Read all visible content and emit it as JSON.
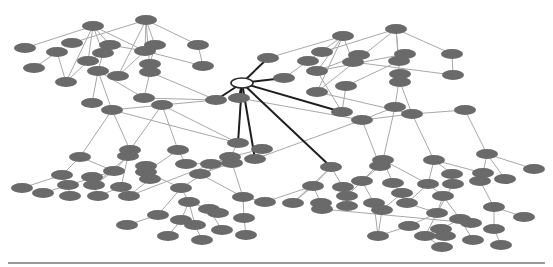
{
  "diagram": {
    "type": "network-graph",
    "colors": {
      "background": "#ffffff",
      "node_fill": "#6a6a6a",
      "edge": "#a8a8a8",
      "hub_edge": "#1e1e1e",
      "hub_fill": "#ffffff",
      "baseline": "#9a9a9a"
    },
    "node_size": {
      "rx": 11,
      "ry": 5
    },
    "hub": {
      "id": "hub",
      "x": 242,
      "y": 83
    },
    "nodes": [
      {
        "id": "a1",
        "x": 93,
        "y": 26
      },
      {
        "id": "a2",
        "x": 146,
        "y": 20
      },
      {
        "id": "a3",
        "x": 25,
        "y": 48
      },
      {
        "id": "a4",
        "x": 72,
        "y": 43
      },
      {
        "id": "a5",
        "x": 57,
        "y": 52
      },
      {
        "id": "a6",
        "x": 110,
        "y": 45
      },
      {
        "id": "a7",
        "x": 103,
        "y": 53
      },
      {
        "id": "a8",
        "x": 155,
        "y": 45
      },
      {
        "id": "a9",
        "x": 145,
        "y": 51
      },
      {
        "id": "a10",
        "x": 150,
        "y": 64
      },
      {
        "id": "a11",
        "x": 88,
        "y": 61
      },
      {
        "id": "a12",
        "x": 34,
        "y": 68
      },
      {
        "id": "a13",
        "x": 150,
        "y": 72
      },
      {
        "id": "a14",
        "x": 98,
        "y": 71
      },
      {
        "id": "a15",
        "x": 118,
        "y": 76
      },
      {
        "id": "a16",
        "x": 66,
        "y": 82
      },
      {
        "id": "a17",
        "x": 198,
        "y": 45
      },
      {
        "id": "a18",
        "x": 203,
        "y": 66
      },
      {
        "id": "a19",
        "x": 144,
        "y": 98
      },
      {
        "id": "a20",
        "x": 92,
        "y": 103
      },
      {
        "id": "a21",
        "x": 112,
        "y": 110
      },
      {
        "id": "a22",
        "x": 162,
        "y": 105
      },
      {
        "id": "a23",
        "x": 216,
        "y": 100
      },
      {
        "id": "b1",
        "x": 343,
        "y": 36
      },
      {
        "id": "b2",
        "x": 396,
        "y": 29
      },
      {
        "id": "b3",
        "x": 268,
        "y": 58
      },
      {
        "id": "b4",
        "x": 322,
        "y": 52
      },
      {
        "id": "b5",
        "x": 308,
        "y": 61
      },
      {
        "id": "b6",
        "x": 359,
        "y": 55
      },
      {
        "id": "b7",
        "x": 353,
        "y": 62
      },
      {
        "id": "b8",
        "x": 405,
        "y": 54
      },
      {
        "id": "b9",
        "x": 399,
        "y": 61
      },
      {
        "id": "b10",
        "x": 284,
        "y": 78
      },
      {
        "id": "b11",
        "x": 317,
        "y": 71
      },
      {
        "id": "b12",
        "x": 452,
        "y": 54
      },
      {
        "id": "b13",
        "x": 453,
        "y": 75
      },
      {
        "id": "b14",
        "x": 400,
        "y": 74
      },
      {
        "id": "b15",
        "x": 400,
        "y": 82
      },
      {
        "id": "b16",
        "x": 317,
        "y": 92
      },
      {
        "id": "b17",
        "x": 346,
        "y": 86
      },
      {
        "id": "b18",
        "x": 395,
        "y": 107
      },
      {
        "id": "b19",
        "x": 342,
        "y": 112
      },
      {
        "id": "b20",
        "x": 362,
        "y": 120
      },
      {
        "id": "b21",
        "x": 412,
        "y": 114
      },
      {
        "id": "b22",
        "x": 465,
        "y": 110
      },
      {
        "id": "b23",
        "x": 239,
        "y": 98
      },
      {
        "id": "c1",
        "x": 80,
        "y": 157
      },
      {
        "id": "c2",
        "x": 130,
        "y": 150
      },
      {
        "id": "c3",
        "x": 128,
        "y": 156
      },
      {
        "id": "c4",
        "x": 178,
        "y": 150
      },
      {
        "id": "c5",
        "x": 238,
        "y": 143
      },
      {
        "id": "c6",
        "x": 262,
        "y": 149
      },
      {
        "id": "c7",
        "x": 230,
        "y": 157
      },
      {
        "id": "c8",
        "x": 232,
        "y": 163
      },
      {
        "id": "c9",
        "x": 255,
        "y": 159
      },
      {
        "id": "c10",
        "x": 62,
        "y": 175
      },
      {
        "id": "c11",
        "x": 92,
        "y": 177
      },
      {
        "id": "c12",
        "x": 114,
        "y": 171
      },
      {
        "id": "c13",
        "x": 146,
        "y": 166
      },
      {
        "id": "c14",
        "x": 186,
        "y": 164
      },
      {
        "id": "c15",
        "x": 211,
        "y": 164
      },
      {
        "id": "c16",
        "x": 146,
        "y": 172
      },
      {
        "id": "c17",
        "x": 22,
        "y": 188
      },
      {
        "id": "c18",
        "x": 43,
        "y": 193
      },
      {
        "id": "c19",
        "x": 68,
        "y": 185
      },
      {
        "id": "c20",
        "x": 94,
        "y": 185
      },
      {
        "id": "c21",
        "x": 121,
        "y": 187
      },
      {
        "id": "c22",
        "x": 150,
        "y": 179
      },
      {
        "id": "c23",
        "x": 181,
        "y": 188
      },
      {
        "id": "c24",
        "x": 200,
        "y": 174
      },
      {
        "id": "c25",
        "x": 70,
        "y": 196
      },
      {
        "id": "c26",
        "x": 98,
        "y": 196
      },
      {
        "id": "c27",
        "x": 129,
        "y": 196
      },
      {
        "id": "c28",
        "x": 189,
        "y": 202
      },
      {
        "id": "c29",
        "x": 243,
        "y": 197
      },
      {
        "id": "c30",
        "x": 265,
        "y": 202
      },
      {
        "id": "c31",
        "x": 158,
        "y": 215
      },
      {
        "id": "c32",
        "x": 181,
        "y": 220
      },
      {
        "id": "c33",
        "x": 209,
        "y": 209
      },
      {
        "id": "c34",
        "x": 218,
        "y": 213
      },
      {
        "id": "c35",
        "x": 127,
        "y": 225
      },
      {
        "id": "c36",
        "x": 195,
        "y": 225
      },
      {
        "id": "c37",
        "x": 244,
        "y": 218
      },
      {
        "id": "c38",
        "x": 222,
        "y": 230
      },
      {
        "id": "c39",
        "x": 168,
        "y": 236
      },
      {
        "id": "c40",
        "x": 202,
        "y": 240
      },
      {
        "id": "c41",
        "x": 246,
        "y": 235
      },
      {
        "id": "d1",
        "x": 331,
        "y": 167
      },
      {
        "id": "d2",
        "x": 383,
        "y": 160
      },
      {
        "id": "d3",
        "x": 380,
        "y": 166
      },
      {
        "id": "d4",
        "x": 434,
        "y": 160
      },
      {
        "id": "d5",
        "x": 487,
        "y": 154
      },
      {
        "id": "d6",
        "x": 313,
        "y": 186
      },
      {
        "id": "d7",
        "x": 343,
        "y": 187
      },
      {
        "id": "d8",
        "x": 362,
        "y": 181
      },
      {
        "id": "d9",
        "x": 393,
        "y": 183
      },
      {
        "id": "d10",
        "x": 428,
        "y": 184
      },
      {
        "id": "d11",
        "x": 402,
        "y": 193
      },
      {
        "id": "d12",
        "x": 452,
        "y": 174
      },
      {
        "id": "d13",
        "x": 483,
        "y": 173
      },
      {
        "id": "d14",
        "x": 480,
        "y": 181
      },
      {
        "id": "d15",
        "x": 505,
        "y": 179
      },
      {
        "id": "d16",
        "x": 534,
        "y": 169
      },
      {
        "id": "d17",
        "x": 453,
        "y": 184
      },
      {
        "id": "d18",
        "x": 293,
        "y": 203
      },
      {
        "id": "d19",
        "x": 321,
        "y": 203
      },
      {
        "id": "d20",
        "x": 347,
        "y": 196
      },
      {
        "id": "d21",
        "x": 347,
        "y": 206
      },
      {
        "id": "d22",
        "x": 374,
        "y": 203
      },
      {
        "id": "d23",
        "x": 382,
        "y": 210
      },
      {
        "id": "d24",
        "x": 407,
        "y": 203
      },
      {
        "id": "d25",
        "x": 443,
        "y": 196
      },
      {
        "id": "d26",
        "x": 322,
        "y": 209
      },
      {
        "id": "d27",
        "x": 494,
        "y": 207
      },
      {
        "id": "d28",
        "x": 437,
        "y": 213
      },
      {
        "id": "d29",
        "x": 460,
        "y": 219
      },
      {
        "id": "d30",
        "x": 471,
        "y": 223
      },
      {
        "id": "d31",
        "x": 524,
        "y": 217
      },
      {
        "id": "d32",
        "x": 378,
        "y": 236
      },
      {
        "id": "d33",
        "x": 409,
        "y": 226
      },
      {
        "id": "d34",
        "x": 425,
        "y": 236
      },
      {
        "id": "d35",
        "x": 441,
        "y": 229
      },
      {
        "id": "d36",
        "x": 445,
        "y": 236
      },
      {
        "id": "d37",
        "x": 473,
        "y": 240
      },
      {
        "id": "d38",
        "x": 494,
        "y": 229
      },
      {
        "id": "d39",
        "x": 501,
        "y": 245
      },
      {
        "id": "d40",
        "x": 442,
        "y": 247
      }
    ],
    "edges": [
      [
        "a1",
        "a3"
      ],
      [
        "a1",
        "a6"
      ],
      [
        "a1",
        "a7"
      ],
      [
        "a1",
        "a16"
      ],
      [
        "a1",
        "a9"
      ],
      [
        "a1",
        "a11"
      ],
      [
        "a2",
        "a4"
      ],
      [
        "a2",
        "a8"
      ],
      [
        "a2",
        "a9"
      ],
      [
        "a2",
        "a13"
      ],
      [
        "a2",
        "a15"
      ],
      [
        "a2",
        "a17"
      ],
      [
        "a5",
        "a12"
      ],
      [
        "a5",
        "a16"
      ],
      [
        "a6",
        "a9"
      ],
      [
        "a7",
        "a11"
      ],
      [
        "a7",
        "a14"
      ],
      [
        "a8",
        "a10"
      ],
      [
        "a9",
        "a18"
      ],
      [
        "a9",
        "a15"
      ],
      [
        "a10",
        "a13"
      ],
      [
        "a11",
        "a16"
      ],
      [
        "a13",
        "a19"
      ],
      [
        "a14",
        "a21"
      ],
      [
        "a14",
        "a20"
      ],
      [
        "a14",
        "a19"
      ],
      [
        "a17",
        "a18"
      ],
      [
        "a13",
        "a23"
      ],
      [
        "a19",
        "a23"
      ],
      [
        "a21",
        "a22"
      ],
      [
        "a22",
        "a23"
      ],
      [
        "a21",
        "c1"
      ],
      [
        "a21",
        "c2"
      ],
      [
        "a22",
        "c2"
      ],
      [
        "a22",
        "c4"
      ],
      [
        "a21",
        "c5"
      ],
      [
        "a22",
        "c5"
      ],
      [
        "b1",
        "b3"
      ],
      [
        "b1",
        "b5"
      ],
      [
        "b1",
        "b11"
      ],
      [
        "b1",
        "b16"
      ],
      [
        "b1",
        "b7"
      ],
      [
        "b2",
        "b4"
      ],
      [
        "b2",
        "b9"
      ],
      [
        "b2",
        "b16"
      ],
      [
        "b2",
        "b15"
      ],
      [
        "b2",
        "b12"
      ],
      [
        "b5",
        "b10"
      ],
      [
        "b6",
        "b11"
      ],
      [
        "b7",
        "b13"
      ],
      [
        "b8",
        "b11"
      ],
      [
        "b9",
        "b17"
      ],
      [
        "b11",
        "b19"
      ],
      [
        "b12",
        "b13"
      ],
      [
        "b14",
        "b18"
      ],
      [
        "b15",
        "b21"
      ],
      [
        "b16",
        "b21"
      ],
      [
        "b17",
        "b19"
      ],
      [
        "b18",
        "b20"
      ],
      [
        "b20",
        "b21"
      ],
      [
        "b21",
        "b22"
      ],
      [
        "b20",
        "b23"
      ],
      [
        "b20",
        "c9"
      ],
      [
        "b20",
        "d3"
      ],
      [
        "b21",
        "d4"
      ],
      [
        "b18",
        "d2"
      ],
      [
        "b22",
        "d5"
      ],
      [
        "c1",
        "c10"
      ],
      [
        "c1",
        "c12"
      ],
      [
        "c3",
        "c12"
      ],
      [
        "c3",
        "c20"
      ],
      [
        "c3",
        "c21"
      ],
      [
        "c4",
        "c14"
      ],
      [
        "c4",
        "c16"
      ],
      [
        "c5",
        "c7"
      ],
      [
        "c6",
        "c7"
      ],
      [
        "c7",
        "c15"
      ],
      [
        "c7",
        "c23"
      ],
      [
        "c8",
        "c29"
      ],
      [
        "c8",
        "c24"
      ],
      [
        "c8",
        "c14"
      ],
      [
        "c10",
        "c17"
      ],
      [
        "c10",
        "c19"
      ],
      [
        "c12",
        "c18"
      ],
      [
        "c12",
        "c20"
      ],
      [
        "c13",
        "c22"
      ],
      [
        "c13",
        "c16"
      ],
      [
        "c15",
        "c24"
      ],
      [
        "c16",
        "c23"
      ],
      [
        "c19",
        "c25"
      ],
      [
        "c20",
        "c26"
      ],
      [
        "c22",
        "c27"
      ],
      [
        "c23",
        "c28"
      ],
      [
        "c23",
        "c31"
      ],
      [
        "c24",
        "c29"
      ],
      [
        "c28",
        "c32"
      ],
      [
        "c28",
        "c33"
      ],
      [
        "c28",
        "c36"
      ],
      [
        "c29",
        "c30"
      ],
      [
        "c29",
        "c37"
      ],
      [
        "c31",
        "c35"
      ],
      [
        "c32",
        "c39"
      ],
      [
        "c33",
        "c34"
      ],
      [
        "c33",
        "c38"
      ],
      [
        "c36",
        "c40"
      ],
      [
        "c37",
        "c41"
      ],
      [
        "c21",
        "c26"
      ],
      [
        "c7",
        "c27"
      ],
      [
        "d1",
        "d6"
      ],
      [
        "d1",
        "d7"
      ],
      [
        "d2",
        "d8"
      ],
      [
        "d2",
        "d9"
      ],
      [
        "d2",
        "d10"
      ],
      [
        "d3",
        "d8"
      ],
      [
        "d4",
        "d10"
      ],
      [
        "d4",
        "d12"
      ],
      [
        "d4",
        "d13"
      ],
      [
        "d5",
        "d13"
      ],
      [
        "d5",
        "d15"
      ],
      [
        "d5",
        "d16"
      ],
      [
        "d6",
        "d18"
      ],
      [
        "d6",
        "d19"
      ],
      [
        "d7",
        "d20"
      ],
      [
        "d8",
        "d20"
      ],
      [
        "d8",
        "d22"
      ],
      [
        "d9",
        "d24"
      ],
      [
        "d10",
        "d24"
      ],
      [
        "d10",
        "d25"
      ],
      [
        "d11",
        "d23"
      ],
      [
        "d12",
        "d17"
      ],
      [
        "d14",
        "d27"
      ],
      [
        "d17",
        "d28"
      ],
      [
        "d20",
        "d21"
      ],
      [
        "d22",
        "d32"
      ],
      [
        "d23",
        "d32"
      ],
      [
        "d24",
        "d28"
      ],
      [
        "d25",
        "d28"
      ],
      [
        "d25",
        "d29"
      ],
      [
        "d26",
        "d30"
      ],
      [
        "d27",
        "d31"
      ],
      [
        "d27",
        "d38"
      ],
      [
        "d28",
        "d33"
      ],
      [
        "d28",
        "d34"
      ],
      [
        "d29",
        "d35"
      ],
      [
        "d29",
        "d37"
      ],
      [
        "d32",
        "d33"
      ],
      [
        "d34",
        "d40"
      ],
      [
        "d35",
        "d36"
      ],
      [
        "d38",
        "d39"
      ],
      [
        "d6",
        "c30"
      ],
      [
        "d1",
        "d18"
      ]
    ],
    "hub_edges": [
      "a23",
      "b3",
      "b10",
      "b23",
      "c5",
      "c9",
      "d1",
      "b19"
    ],
    "baseline": {
      "x1": 8,
      "x2": 545,
      "y": 263
    }
  }
}
